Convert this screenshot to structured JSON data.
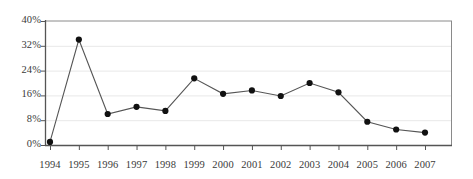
{
  "chart_data": {
    "type": "line",
    "title": "",
    "subtitle": "",
    "xlabel": "",
    "ylabel": "",
    "categories": [
      "1994",
      "1995",
      "1996",
      "1997",
      "1998",
      "1999",
      "2000",
      "2001",
      "2002",
      "2003",
      "2004",
      "2005",
      "2006",
      "2007"
    ],
    "values": [
      1,
      34,
      10,
      12.3,
      11,
      21.5,
      16.5,
      17.6,
      15.8,
      20,
      17,
      7.5,
      5,
      4
    ],
    "ylim": [
      0,
      40
    ],
    "ytick_labels": [
      "0%",
      "8%",
      "16%",
      "24%",
      "32%",
      "40%"
    ],
    "ytick_values": [
      0,
      8,
      16,
      24,
      32,
      40
    ],
    "grid": true,
    "grid_axis": "y",
    "legend": null,
    "legend_position": "none",
    "series": [
      {
        "name": "series-1",
        "values": [
          1,
          34,
          10,
          12.3,
          11,
          21.5,
          16.5,
          17.6,
          15.8,
          20,
          17,
          7.5,
          5,
          4
        ],
        "line_color": "#555555",
        "marker_color": "#111111",
        "marker": "circle"
      }
    ],
    "colors": {
      "background": "#ffffff",
      "axis": "#555555",
      "gridline": "#e8e8e8",
      "line": "#555555",
      "marker": "#111111",
      "text": "#3a3a3a"
    }
  }
}
